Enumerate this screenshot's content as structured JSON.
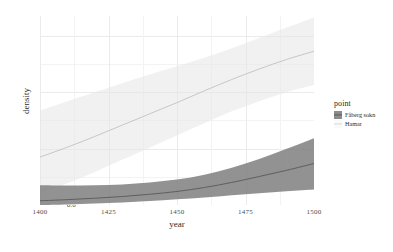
{
  "chart_data": {
    "type": "line",
    "title": "",
    "subtitle": "",
    "xlabel": "year",
    "ylabel": "density",
    "xlim": [
      1400,
      1500
    ],
    "ylim": [
      0.0,
      0.67
    ],
    "xticks": [
      1400,
      1425,
      1450,
      1475,
      1500
    ],
    "xtick_labels": [
      "1400",
      "1425",
      "1450",
      "1475",
      "1500"
    ],
    "yticks": [
      0.0,
      0.2,
      0.4,
      0.6
    ],
    "ytick_labels": [
      "0.0",
      "0.2",
      "0.4",
      "0.6"
    ],
    "grid": true,
    "legend_position": "right",
    "legend_title": "point",
    "x": [
      1400,
      1410,
      1420,
      1430,
      1440,
      1450,
      1460,
      1470,
      1480,
      1490,
      1500
    ],
    "series": [
      {
        "name": "Fåberg sokn",
        "color": "#595959",
        "ribbon_color": "#7f7f7f",
        "values": [
          0.015,
          0.019,
          0.024,
          0.03,
          0.038,
          0.048,
          0.062,
          0.08,
          0.101,
          0.123,
          0.147
        ],
        "ribbon_lower": [
          0.0,
          0.002,
          0.005,
          0.009,
          0.014,
          0.02,
          0.027,
          0.035,
          0.042,
          0.049,
          0.055
        ],
        "ribbon_upper": [
          0.07,
          0.069,
          0.07,
          0.073,
          0.08,
          0.09,
          0.107,
          0.132,
          0.163,
          0.199,
          0.237
        ]
      },
      {
        "name": "Hamar",
        "color": "#c2c2c2",
        "ribbon_color": "#e6e6e6",
        "values": [
          0.17,
          0.205,
          0.243,
          0.283,
          0.323,
          0.363,
          0.405,
          0.445,
          0.482,
          0.516,
          0.545
        ],
        "ribbon_lower": [
          0.04,
          0.077,
          0.117,
          0.16,
          0.203,
          0.247,
          0.29,
          0.332,
          0.368,
          0.4,
          0.425
        ],
        "ribbon_upper": [
          0.335,
          0.368,
          0.4,
          0.432,
          0.463,
          0.492,
          0.522,
          0.556,
          0.592,
          0.629,
          0.665
        ]
      }
    ]
  },
  "axes": {
    "x_label": "year",
    "y_label": "density"
  },
  "legend": {
    "title": "point",
    "items": [
      {
        "label": "Fåberg sokn",
        "swatch": "#595959",
        "key_type": "filled-square"
      },
      {
        "label": "Hamar",
        "swatch": "#d9d9d9",
        "key_type": "line"
      }
    ]
  }
}
